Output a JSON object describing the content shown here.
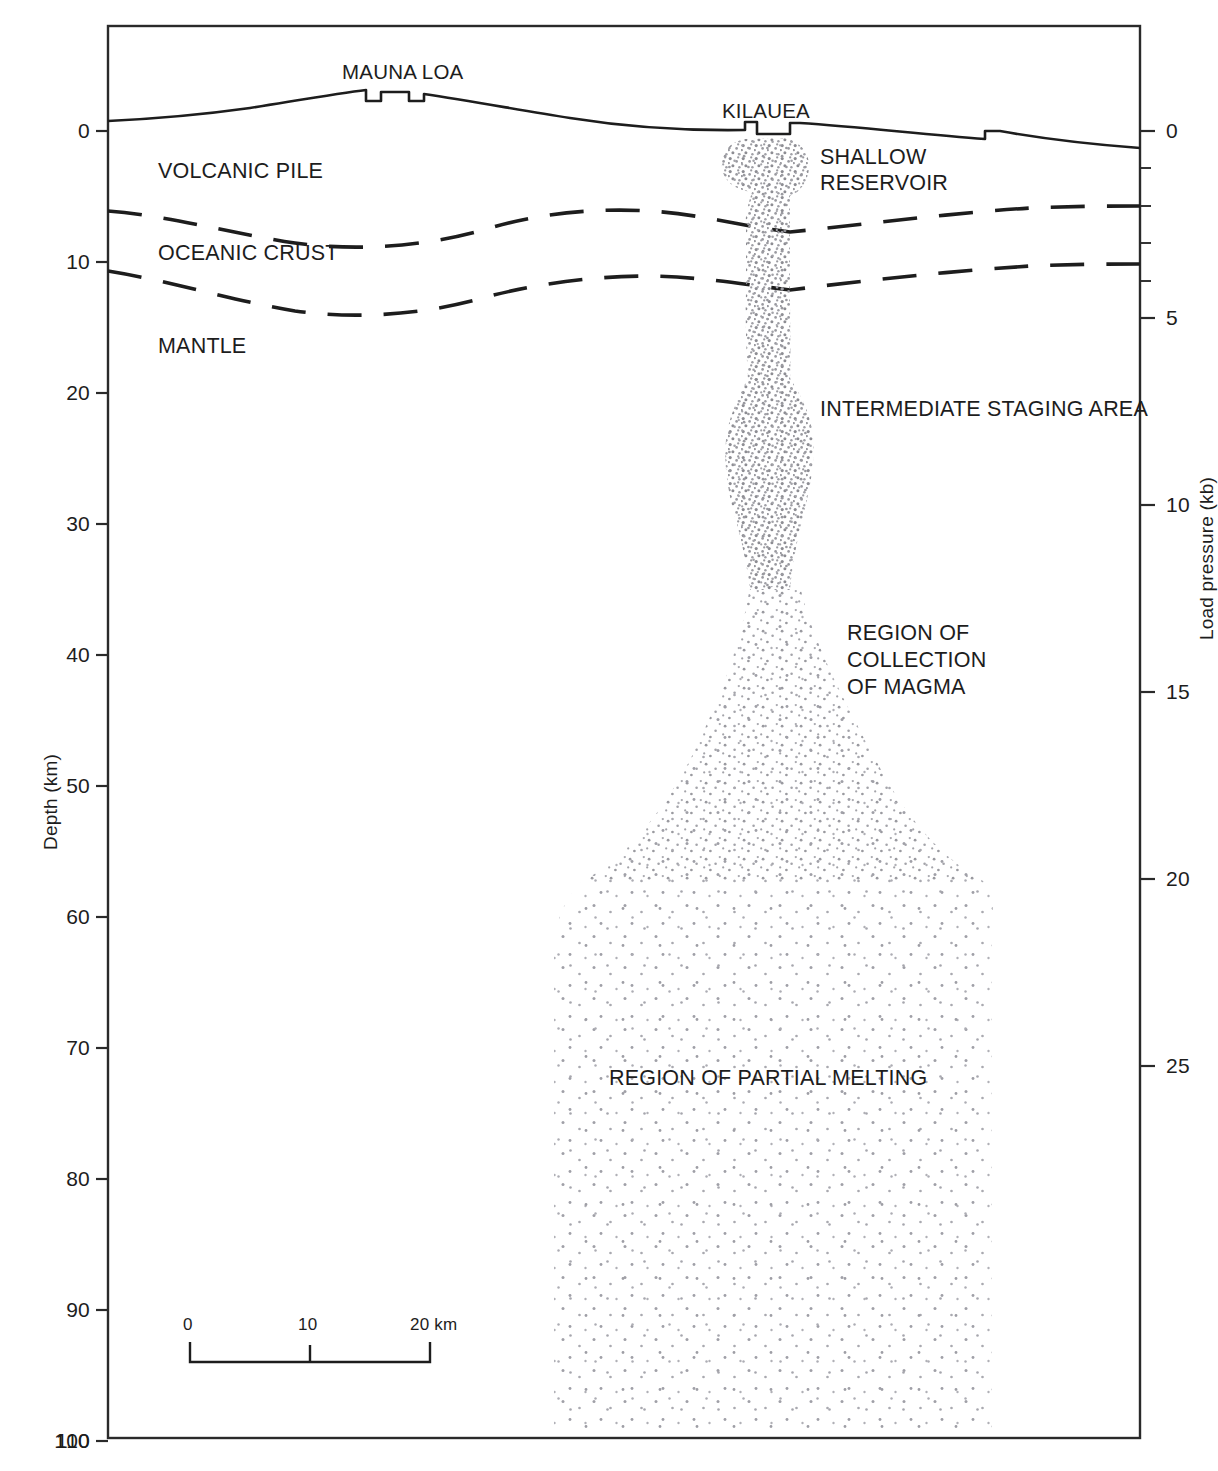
{
  "figure": {
    "kind": "geological-cross-section"
  },
  "axes": {
    "left": {
      "title": "Depth (km)",
      "unit": "km",
      "ticks": [
        0,
        10,
        20,
        30,
        40,
        50,
        60,
        70,
        80,
        90,
        100,
        110
      ],
      "range": [
        -5,
        110
      ]
    },
    "right": {
      "title": "Load pressure (kb)",
      "unit": "kb",
      "ticks": [
        0,
        5,
        10,
        15,
        20,
        25
      ],
      "minor_ticks": [
        1,
        2,
        3,
        4,
        6,
        7,
        8,
        9,
        11,
        12,
        13,
        14,
        16,
        17,
        18,
        19,
        21,
        22,
        23,
        24,
        26
      ],
      "range": [
        -1.5,
        28
      ]
    }
  },
  "scalebar": {
    "ticks": [
      "0",
      "10",
      "20 km"
    ],
    "length_km": 20
  },
  "peaks": [
    {
      "name": "MAUNA LOA"
    },
    {
      "name": "KILAUEA"
    }
  ],
  "strata": [
    {
      "name": "VOLCANIC PILE"
    },
    {
      "name": "OCEANIC CRUST"
    },
    {
      "name": "MANTLE"
    }
  ],
  "magma_features": [
    {
      "name": "SHALLOW\nRESERVOIR",
      "line1": "SHALLOW",
      "line2": "RESERVOIR"
    },
    {
      "name": "INTERMEDIATE STAGING AREA"
    },
    {
      "name": "REGION OF\nCOLLECTION\nOF MAGMA",
      "line1": "REGION OF",
      "line2": "COLLECTION",
      "line3": "OF MAGMA"
    },
    {
      "name": "REGION OF PARTIAL MELTING"
    }
  ],
  "labels": {
    "mauna_loa": "MAUNA LOA",
    "kilauea": "KILAUEA",
    "volcanic_pile": "VOLCANIC PILE",
    "oceanic_crust": "OCEANIC CRUST",
    "mantle": "MANTLE",
    "shallow_reservoir_1": "SHALLOW",
    "shallow_reservoir_2": "RESERVOIR",
    "intermediate_staging": "INTERMEDIATE STAGING AREA",
    "collection_1": "REGION OF",
    "collection_2": "COLLECTION",
    "collection_3": "OF MAGMA",
    "partial_melting": "REGION OF PARTIAL MELTING",
    "depth_axis": "Depth (km)",
    "pressure_axis": "Load pressure (kb)",
    "scale_0": "0",
    "scale_10": "10",
    "scale_20": "20 km",
    "d0": "0",
    "d10": "10",
    "d20": "20",
    "d30": "30",
    "d40": "40",
    "d50": "50",
    "d60": "60",
    "d70": "70",
    "d80": "80",
    "d90": "90",
    "d100": "100",
    "d110": "110",
    "p0": "0",
    "p5": "5",
    "p10": "10",
    "p15": "15",
    "p20": "20",
    "p25": "25"
  },
  "colors": {
    "ink": "#1d1d1d",
    "frame": "#2a2a2a",
    "stipple": "#8d8d93",
    "background": "#ffffff"
  }
}
